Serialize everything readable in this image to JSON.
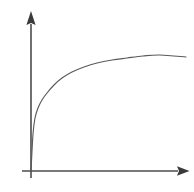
{
  "figure": {
    "background_color": "#ffffff",
    "axis_color": "#4d4d4d",
    "curve_color": "#5a5a5a",
    "width": 194,
    "height": 192,
    "title": "",
    "alt_text": "Line graph with unlabeled arrowed axes showing a concave increasing curve that rises steeply from the origin and then flattens toward a plateau"
  },
  "chart_data": {
    "type": "line",
    "title": "",
    "subtitle": "",
    "xlabel": "",
    "ylabel": "",
    "legend": [],
    "legend_position": "none",
    "grid": false,
    "xlim": [
      0,
      1
    ],
    "ylim": [
      0,
      1
    ],
    "xticks": [],
    "yticks": [],
    "xticklabels": [],
    "yticklabels": [],
    "annotations": [],
    "axes": {
      "x_axis": {
        "arrow": true,
        "arrow_position": "right",
        "start_px": [
          22,
          171
        ],
        "end_px": [
          189,
          171
        ]
      },
      "y_axis": {
        "arrow": true,
        "arrow_position": "top",
        "start_px": [
          31,
          178
        ],
        "end_px": [
          31,
          11
        ]
      }
    },
    "series": [
      {
        "name": "curve",
        "shape": "concave-increasing-saturating",
        "x": [
          0.0,
          0.02,
          0.05,
          0.09,
          0.14,
          0.2,
          0.27,
          0.35,
          0.44,
          0.53,
          0.62,
          0.71,
          0.79,
          0.87,
          0.94,
          1.0
        ],
        "y": [
          0.0,
          0.22,
          0.38,
          0.5,
          0.6,
          0.68,
          0.75,
          0.81,
          0.86,
          0.9,
          0.93,
          0.96,
          0.98,
          0.99,
          1.0,
          0.99
        ],
        "points_px": [
          [
            31,
            171
          ],
          [
            33,
            134
          ],
          [
            35,
            118
          ],
          [
            38,
            108
          ],
          [
            42,
            100
          ],
          [
            47,
            93
          ],
          [
            54,
            85
          ],
          [
            62,
            78
          ],
          [
            72,
            72
          ],
          [
            84,
            67
          ],
          [
            97,
            63
          ],
          [
            112,
            60
          ],
          [
            127,
            58
          ],
          [
            143,
            56
          ],
          [
            160,
            55
          ],
          [
            186,
            57
          ]
        ]
      }
    ]
  }
}
